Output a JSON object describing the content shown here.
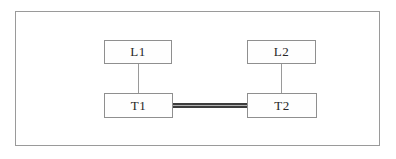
{
  "diagram": {
    "type": "network-diagram",
    "nodes": {
      "l1": {
        "label": "L1"
      },
      "l2": {
        "label": "L2"
      },
      "t1": {
        "label": "T1"
      },
      "t2": {
        "label": "T2"
      }
    },
    "connections": [
      {
        "from": "L1",
        "to": "T1",
        "style": "thin-single-line"
      },
      {
        "from": "L2",
        "to": "T2",
        "style": "thin-single-line"
      },
      {
        "from": "T1",
        "to": "T2",
        "style": "thick-double-line"
      }
    ],
    "colors": {
      "background": "#ffffff",
      "frame_border": "#9a9a9a",
      "node_border": "#8f8f8f",
      "node_fill": "#fefefe",
      "text": "#262626",
      "thin_link": "#9a9a9a",
      "thick_link": "#3c3c3c"
    }
  }
}
